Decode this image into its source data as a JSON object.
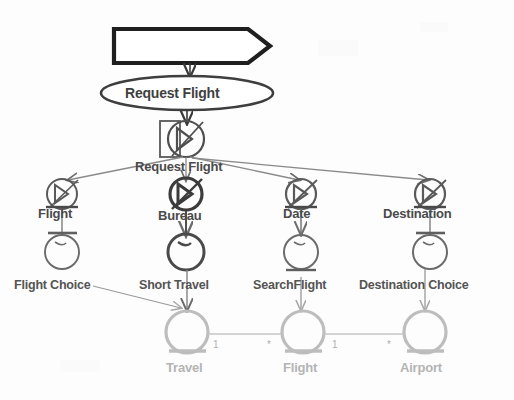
{
  "diagram": {
    "background_color": "#fdfdfd",
    "ink_dark": "#2b2b2b",
    "ink_mid": "#555555",
    "ink_light": "#bdbdbd",
    "start_banner": {
      "shape": "arrow-banner",
      "label": ""
    },
    "root_use_case": {
      "shape": "ellipse",
      "label": "Request Flight"
    },
    "root_task": {
      "icon": "interaction-task-icon",
      "label": "Request Flight"
    },
    "tasks": [
      {
        "icon": "interaction-task-icon",
        "label": "Flight",
        "emphasis": "normal"
      },
      {
        "icon": "interaction-task-icon",
        "label": "Bureau",
        "emphasis": "bold"
      },
      {
        "icon": "interaction-task-icon",
        "label": "Date",
        "emphasis": "normal"
      },
      {
        "icon": "interaction-task-icon",
        "label": "Destination",
        "emphasis": "normal"
      }
    ],
    "objects": [
      {
        "icon": "object-circle-icon",
        "label": "Flight Choice",
        "emphasis": "normal"
      },
      {
        "icon": "object-circle-icon",
        "label": "Short Travel",
        "emphasis": "bold"
      },
      {
        "icon": "object-circle-icon",
        "label": "SearchFlight",
        "emphasis": "normal"
      },
      {
        "icon": "object-circle-icon",
        "label": "Destination Choice",
        "emphasis": "normal"
      }
    ],
    "entities": [
      {
        "icon": "entity-circle-icon",
        "label": "Travel"
      },
      {
        "icon": "entity-circle-icon",
        "label": "Flight"
      },
      {
        "icon": "entity-circle-icon",
        "label": "Airport"
      }
    ],
    "associations": [
      {
        "from": "Travel",
        "to": "Flight",
        "from_multiplicity": "1",
        "to_multiplicity": "*"
      },
      {
        "from": "Flight",
        "to": "Airport",
        "from_multiplicity": "1",
        "to_multiplicity": "*"
      }
    ]
  }
}
